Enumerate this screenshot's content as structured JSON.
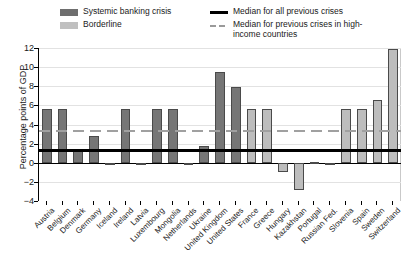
{
  "legend": {
    "items": [
      {
        "key": "systemic",
        "label": "Systemic banking crisis",
        "swatch": "dark-bar-swatch",
        "color": "#6e6e6e"
      },
      {
        "key": "borderline",
        "label": "Borderline",
        "swatch": "light-bar-swatch",
        "color": "#c0c0c0"
      },
      {
        "key": "median_all",
        "label": "Median for all previous crises",
        "swatch": "solid-line-swatch",
        "color": "#000000"
      },
      {
        "key": "median_high_income",
        "label": "Median for previous crises in high-income countries",
        "swatch": "dashed-line-swatch",
        "color": "#9a9a9a"
      }
    ]
  },
  "chart_data": {
    "type": "bar",
    "title": "",
    "xlabel": "",
    "ylabel": "Percentage points of GDP",
    "ylim": [
      -4,
      12
    ],
    "yticks": [
      -4,
      -2,
      0,
      2,
      4,
      6,
      8,
      10,
      12
    ],
    "ytick_labels": [
      "−4",
      "−2",
      "0",
      "2",
      "4",
      "6",
      "8",
      "10",
      "12"
    ],
    "grid": true,
    "legend_position": "top",
    "categories": [
      "Austria",
      "Belgium",
      "Denmark",
      "Germany",
      "Iceland",
      "Ireland",
      "Latvia",
      "Luxembourg",
      "Mongolia",
      "Netherlands",
      "Ukraine",
      "United Kingdom",
      "United States",
      "France",
      "Greece",
      "Hungary",
      "Kazakhstan",
      "Portugal",
      "Russian Fed.",
      "Slovenia",
      "Spain",
      "Sweden",
      "Switzerland"
    ],
    "values": [
      5.6,
      5.6,
      1.4,
      2.8,
      -0.2,
      5.6,
      -0.1,
      5.6,
      5.6,
      -0.2,
      1.7,
      9.5,
      7.9,
      5.6,
      5.6,
      -1.0,
      -2.8,
      0.05,
      -0.2,
      5.6,
      5.6,
      6.6,
      11.9
    ],
    "series_group": [
      "systemic",
      "systemic",
      "systemic",
      "systemic",
      "systemic",
      "systemic",
      "systemic",
      "systemic",
      "systemic",
      "systemic",
      "systemic",
      "systemic",
      "systemic",
      "borderline",
      "borderline",
      "borderline",
      "borderline",
      "borderline",
      "borderline",
      "borderline",
      "borderline",
      "borderline",
      "borderline"
    ],
    "reference_lines": [
      {
        "name": "median_all",
        "value": 1.4,
        "style": "solid",
        "color": "#000000"
      },
      {
        "name": "median_high_income",
        "value": 3.4,
        "style": "dashed",
        "color": "#9a9a9a"
      }
    ]
  }
}
